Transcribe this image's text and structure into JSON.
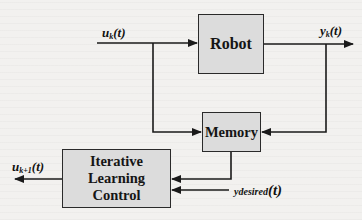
{
  "diagram": {
    "type": "block-diagram",
    "blocks": [
      {
        "id": "robot",
        "label": "Robot"
      },
      {
        "id": "memory",
        "label": "Memory"
      },
      {
        "id": "ilc",
        "label": "Iterative Learning Control",
        "lines": [
          "Iterative",
          "Learning",
          "Control"
        ]
      }
    ],
    "signals": {
      "input": {
        "base": "u",
        "sub": "k",
        "arg": "(t)"
      },
      "output": {
        "base": "y",
        "sub": "k",
        "arg": "(t)"
      },
      "next_input": {
        "base": "u",
        "sub": "k+1",
        "arg": "(t)"
      },
      "desired": {
        "base": "y",
        "sub": "desired",
        "arg": "(t)"
      }
    },
    "edges": [
      {
        "from": "u_k(t)",
        "to": "robot"
      },
      {
        "from": "u_k(t)",
        "to": "memory"
      },
      {
        "from": "robot",
        "to": "y_k(t)"
      },
      {
        "from": "y_k(t)",
        "to": "memory"
      },
      {
        "from": "memory",
        "to": "ilc"
      },
      {
        "from": "y_desired(t)",
        "to": "ilc"
      },
      {
        "from": "ilc",
        "to": "u_k+1(t)"
      }
    ],
    "colors": {
      "background": "#f2f1ef",
      "block_fill": "#dcdcdc",
      "line": "#1a1a1a"
    }
  }
}
